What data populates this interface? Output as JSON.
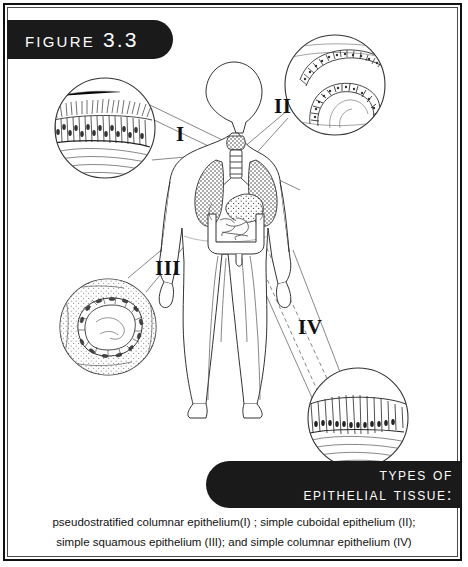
{
  "figure": {
    "banner_label": "Figure 3.3",
    "title_line_1": "Types of",
    "title_line_2": "epithelial tissue:",
    "caption_line_1": "pseudostratified columnar epithelium(I) ; simple cuboidal epithelium (II);",
    "caption_line_2": "simple squamous epithelium (III); and simple columnar epithelium (IV)"
  },
  "labels": {
    "i": "I",
    "ii": "II",
    "iii": "III",
    "iv": "IV"
  },
  "insets": [
    {
      "id": "I",
      "tissue": "pseudostratified columnar epithelium",
      "site": "trachea",
      "description": "ciliated tall cells in a single layer with nuclei at varied heights"
    },
    {
      "id": "II",
      "tissue": "simple cuboidal epithelium",
      "site": "kidney tubules",
      "description": "rings of cube-shaped cells forming tubule cross sections"
    },
    {
      "id": "III",
      "tissue": "simple squamous epithelium",
      "site": "blood vessel / capillary",
      "description": "flattened cells forming a thin ring around a lumen"
    },
    {
      "id": "IV",
      "tissue": "simple columnar epithelium",
      "site": "intestine",
      "description": "single row of tall column-shaped cells with basal nuclei"
    }
  ],
  "anatomy": {
    "organs": [
      "trachea",
      "lungs",
      "stomach",
      "large intestine",
      "small intestine"
    ]
  },
  "colors": {
    "banner": "#1a1a1a",
    "banner_text": "#ffffff",
    "ink": "#111111",
    "paper": "#ffffff"
  }
}
